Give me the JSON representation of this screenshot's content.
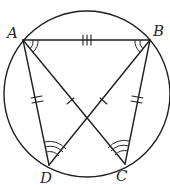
{
  "diagram": {
    "type": "geometry",
    "stroke_color": "#1f1f1f",
    "background": "#ffffff",
    "circle": {
      "cx": 87,
      "cy": 94,
      "r": 83
    },
    "points": {
      "A": {
        "label": "A",
        "x": 23,
        "y": 40
      },
      "B": {
        "label": "B",
        "x": 150,
        "y": 40
      },
      "C": {
        "label": "C",
        "x": 125,
        "y": 164
      },
      "D": {
        "label": "D",
        "x": 49,
        "y": 165
      }
    },
    "segments": [
      "AB",
      "AD",
      "BC",
      "AC",
      "BD"
    ],
    "tick_marks": {
      "AB": 3,
      "AD": 2,
      "BC": 2,
      "AC": 1,
      "BD": 1
    },
    "angle_marks": {
      "A": 2,
      "B": 2,
      "C": 3,
      "D": 3
    }
  }
}
